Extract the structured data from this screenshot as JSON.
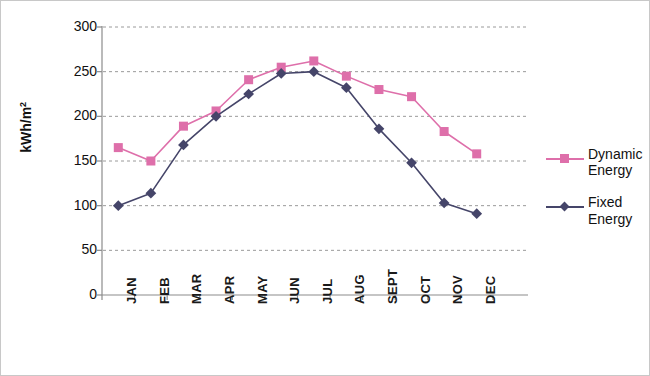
{
  "chart_data": {
    "type": "line",
    "title": "",
    "xlabel": "",
    "ylabel": "kWh/m2",
    "ylabel_base": "kWh/m",
    "ylabel_exponent": "2",
    "categories": [
      "JAN",
      "FEB",
      "MAR",
      "APR",
      "MAY",
      "JUN",
      "JUL",
      "AUG",
      "SEPT",
      "OCT",
      "NOV",
      "DEC"
    ],
    "series": [
      {
        "name": "Dynamic Energy",
        "legend_label_line1": "Dynamic",
        "legend_label_line2": "Energy",
        "color": "#DE6FAA",
        "marker": "square",
        "values": [
          165,
          150,
          189,
          206,
          241,
          255,
          262,
          245,
          230,
          222,
          183,
          158
        ]
      },
      {
        "name": "Fixed Energy",
        "legend_label_line1": "Fixed",
        "legend_label_line2": "Energy",
        "color": "#454569",
        "marker": "diamond",
        "values": [
          100,
          114,
          168,
          200,
          225,
          248,
          250,
          232,
          186,
          148,
          103,
          91
        ]
      }
    ],
    "ylim": [
      0,
      300
    ],
    "yticks": [
      "0",
      "50",
      "100",
      "150",
      "200",
      "250",
      "300"
    ],
    "ytick_values": [
      0,
      50,
      100,
      150,
      200,
      250,
      300
    ],
    "grid": "horizontal-dashed",
    "legend_position": "right"
  }
}
